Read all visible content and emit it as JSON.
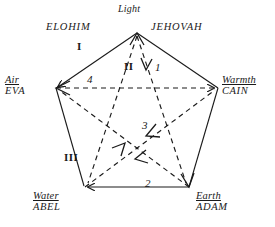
{
  "diagram": {
    "title_label": "Light",
    "vertices": [
      {
        "id": "light",
        "element": "Light",
        "person": "",
        "underline": false
      },
      {
        "id": "air",
        "element": "Air",
        "person": "EVA",
        "underline": true
      },
      {
        "id": "warmth",
        "element": "Warmth",
        "person": "CAIN",
        "underline": true
      },
      {
        "id": "water",
        "element": "Water",
        "person": "ABEL",
        "underline": true
      },
      {
        "id": "earth",
        "element": "Earth",
        "person": "ADAM",
        "underline": true
      }
    ],
    "names": [
      {
        "id": "elohim",
        "text": "ELOHIM"
      },
      {
        "id": "jehovah",
        "text": "JEHOVAH"
      }
    ],
    "edge_markers": [
      {
        "id": "marker-I",
        "text": "I"
      },
      {
        "id": "marker-II",
        "text": "II"
      },
      {
        "id": "marker-III",
        "text": "III"
      },
      {
        "id": "marker-1",
        "text": "1"
      },
      {
        "id": "marker-2",
        "text": "2"
      },
      {
        "id": "marker-3",
        "text": "3"
      },
      {
        "id": "marker-4",
        "text": "4"
      }
    ],
    "colors": {
      "ink": "#1a1a1a",
      "background": "#ffffff"
    }
  }
}
